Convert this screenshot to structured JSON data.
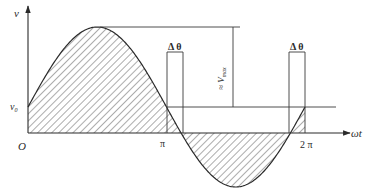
{
  "diagram": {
    "title": "",
    "labels": {
      "y_axis": "v",
      "x_axis": "ωt",
      "origin": "O",
      "v0": "v",
      "v0_sub": "0",
      "pi": "π",
      "two_pi": "2 π",
      "delta_theta_left": "Δ θ",
      "delta_theta_right": "Δ θ",
      "amplitude": "≈ V",
      "amplitude_sub": "max"
    },
    "colors": {
      "line": "#3a3a3a",
      "hatch": "#5a5a5a",
      "background": "#ffffff"
    },
    "curve": {
      "type": "sine",
      "description": "v = v0 + Vmax·sin(ωt), one full period from 0 to 2π; shaded areas between curve and the ωt axis",
      "origin_px": [
        28,
        133
      ],
      "period_px": 277,
      "offset_px": 26,
      "amplitude_px": 80
    },
    "markers": [
      {
        "name": "pi",
        "x_px": 166.5
      },
      {
        "name": "two-pi",
        "x_px": 305
      }
    ]
  }
}
